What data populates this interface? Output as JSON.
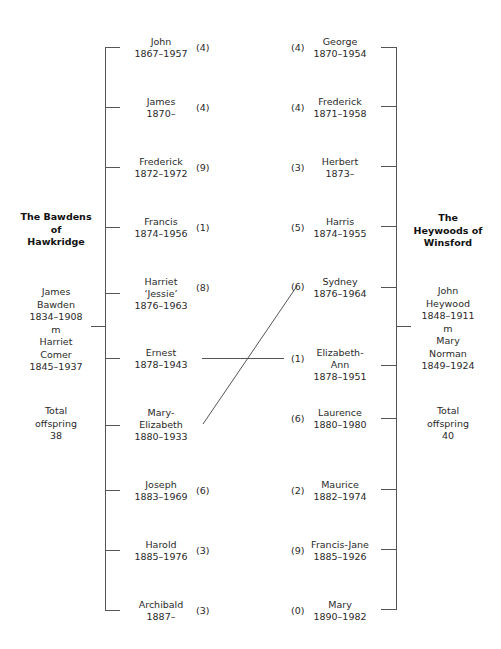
{
  "left_family": {
    "title": "The Bawdens\nof\nHawkridge",
    "parents": "James\nBawden\n1834–1908\nm\nHarriet\nComer\n1845–1937",
    "total": "Total\noffspring\n38",
    "children": [
      {
        "name": "John",
        "dates": "1867–1957",
        "offspring": "(4)"
      },
      {
        "name": "James",
        "dates": "1870–",
        "offspring": "(4)"
      },
      {
        "name": "Frederick",
        "dates": "1872–1972",
        "offspring": "(9)"
      },
      {
        "name": "Francis",
        "dates": "1874–1956",
        "offspring": "(1)"
      },
      {
        "name": "Harriet\n‘Jessie’",
        "dates": "1876–1963",
        "offspring": "(8)"
      },
      {
        "name": "Ernest",
        "dates": "1878–1943",
        "offspring": ""
      },
      {
        "name": "Mary-\nElizabeth",
        "dates": "1880–1933",
        "offspring": ""
      },
      {
        "name": "Joseph",
        "dates": "1883–1969",
        "offspring": "(6)"
      },
      {
        "name": "Harold",
        "dates": "1885–1976",
        "offspring": "(3)"
      },
      {
        "name": "Archibald",
        "dates": "1887–",
        "offspring": "(3)"
      }
    ]
  },
  "right_family": {
    "title": "The\nHeywoods of\nWinsford",
    "parents": "John\nHeywood\n1848–1911\nm\nMary\nNorman\n1849–1924",
    "total": "Total\noffspring\n40",
    "children": [
      {
        "name": "George",
        "dates": "1870–1954",
        "offspring": "(4)"
      },
      {
        "name": "Frederick",
        "dates": "1871–1958",
        "offspring": "(4)"
      },
      {
        "name": "Herbert",
        "dates": "1873–",
        "offspring": "(3)"
      },
      {
        "name": "Harris",
        "dates": "1874–1955",
        "offspring": "(5)"
      },
      {
        "name": "Sydney",
        "dates": "1876–1964",
        "offspring": "(6)"
      },
      {
        "name": "Elizabeth-\nAnn",
        "dates": "1878–1951",
        "offspring": "(1)"
      },
      {
        "name": "Laurence",
        "dates": "1880–1980",
        "offspring": "(6)"
      },
      {
        "name": "Maurice",
        "dates": "1882–1974",
        "offspring": "(2)"
      },
      {
        "name": "Francis-Jane",
        "dates": "1885–1926",
        "offspring": "(9)"
      },
      {
        "name": "Mary",
        "dates": "1890–1982",
        "offspring": "(0)"
      }
    ]
  },
  "marriages": [
    {
      "from": "Ernest 1878–1943",
      "to": "Elizabeth-Ann 1878–1951"
    },
    {
      "from": "Mary-Elizabeth 1880–1933",
      "to": "Sydney 1876–1964"
    }
  ]
}
